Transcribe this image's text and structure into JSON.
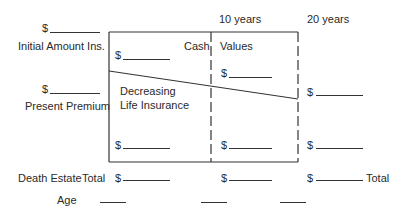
{
  "headers": {
    "col_10": "10 years",
    "col_20": "20 years"
  },
  "left_labels": {
    "initial_amount": "Initial Amount Ins.",
    "present_premium": "Present Premium",
    "death_estate": "Death Estate",
    "total_left": "Total",
    "age": "Age"
  },
  "box_labels": {
    "cash": "Cash",
    "values": "Values",
    "decreasing": "Decreasing",
    "life_insurance": "Life Insurance"
  },
  "right_labels": {
    "total_right": "Total"
  },
  "currency_symbol": "$"
}
